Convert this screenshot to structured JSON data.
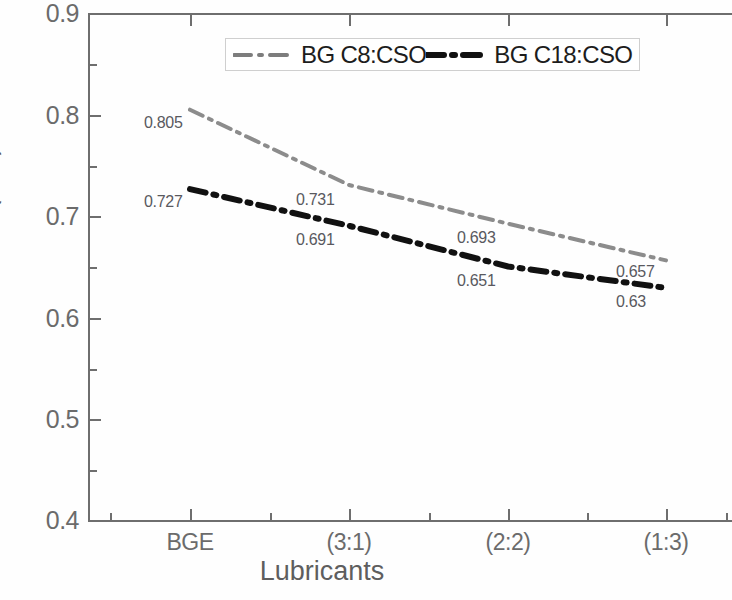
{
  "chart_data": {
    "type": "line",
    "title": "",
    "xlabel": "Lubricants",
    "ylabel": "Wear Scar Diameter(mm)",
    "categories": [
      "BGE",
      "(3:1)",
      "(2:2)",
      "(1:3)"
    ],
    "xtick_labels": [
      "BGE",
      "(3:1)",
      "(2:2)",
      "(1:3)"
    ],
    "ytick_labels": [
      "0.9",
      "0.8",
      "0.7",
      "0.6",
      "0.5",
      "0.4"
    ],
    "ytick_values": [
      0.9,
      0.8,
      0.7,
      0.6,
      0.5,
      0.4
    ],
    "ylim": [
      0.4,
      0.9
    ],
    "y_minor_step": 0.05,
    "grid": false,
    "legend_position": "top-center",
    "series": [
      {
        "name": "BG C8:CSO",
        "values": [
          0.805,
          0.731,
          0.693,
          0.657
        ],
        "labels": [
          "0.805",
          "0.731",
          "0.693",
          "0.657"
        ],
        "color": "#8c8c8c",
        "style": "dash-dot"
      },
      {
        "name": "BG C18:CSO",
        "values": [
          0.727,
          0.691,
          0.651,
          0.63
        ],
        "labels": [
          "0.727",
          "0.691",
          "0.651",
          "0.63"
        ],
        "color": "#111111",
        "style": "dash-dot"
      }
    ]
  },
  "axes": {
    "y_title": "Wear Scar Diameter(mm)",
    "x_title": "Lubricants",
    "y_ticks": [
      {
        "label": "0.9",
        "value": 0.9
      },
      {
        "label": "0.8",
        "value": 0.8
      },
      {
        "label": "0.7",
        "value": 0.7
      },
      {
        "label": "0.6",
        "value": 0.6
      },
      {
        "label": "0.5",
        "value": 0.5
      },
      {
        "label": "0.4",
        "value": 0.4
      }
    ],
    "x_ticks": [
      {
        "label": "BGE"
      },
      {
        "label": "(3:1)"
      },
      {
        "label": "(2:2)"
      },
      {
        "label": "(1:3)"
      }
    ]
  },
  "legend": {
    "entries": [
      {
        "label": "BG C8:CSO",
        "color": "#8c8c8c"
      },
      {
        "label": "BG C18:CSO",
        "color": "#111111"
      }
    ]
  },
  "point_labels": {
    "s1_p1": "0.805",
    "s1_p2": "0.731",
    "s1_p3": "0.693",
    "s1_p4": "0.657",
    "s2_p1": "0.727",
    "s2_p2": "0.691",
    "s2_p3": "0.651",
    "s2_p4": "0.63"
  }
}
